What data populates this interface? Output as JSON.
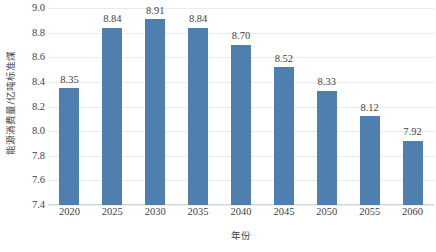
{
  "chart_data": {
    "type": "bar",
    "title": "",
    "categories": [
      "2020",
      "2025",
      "2030",
      "2035",
      "2040",
      "2045",
      "2050",
      "2055",
      "2060"
    ],
    "values": [
      8.35,
      8.84,
      8.91,
      8.84,
      8.7,
      8.52,
      8.33,
      8.12,
      7.92
    ],
    "data_labels": [
      "8.35",
      "8.84",
      "8.91",
      "8.84",
      "8.70",
      "8.52",
      "8.33",
      "8.12",
      "7.92"
    ],
    "xlabel": "年份",
    "ylabel": "能源消费量/亿吨标准煤",
    "ylim": [
      7.4,
      9.0
    ],
    "ytick_step": 0.2,
    "ytick_labels": [
      "9.0",
      "8.8",
      "8.6",
      "8.4",
      "8.2",
      "8.0",
      "7.8",
      "7.6",
      "7.4"
    ],
    "ytick_values": [
      9.0,
      8.8,
      8.6,
      8.4,
      8.2,
      8.0,
      7.8,
      7.6,
      7.4
    ],
    "grid": "horizontal",
    "legend": "none",
    "series_color": "#4e7fae",
    "gridline_color": "#e9ebed",
    "background_color": "#ffffff",
    "text_color": "#3f3f3f"
  }
}
